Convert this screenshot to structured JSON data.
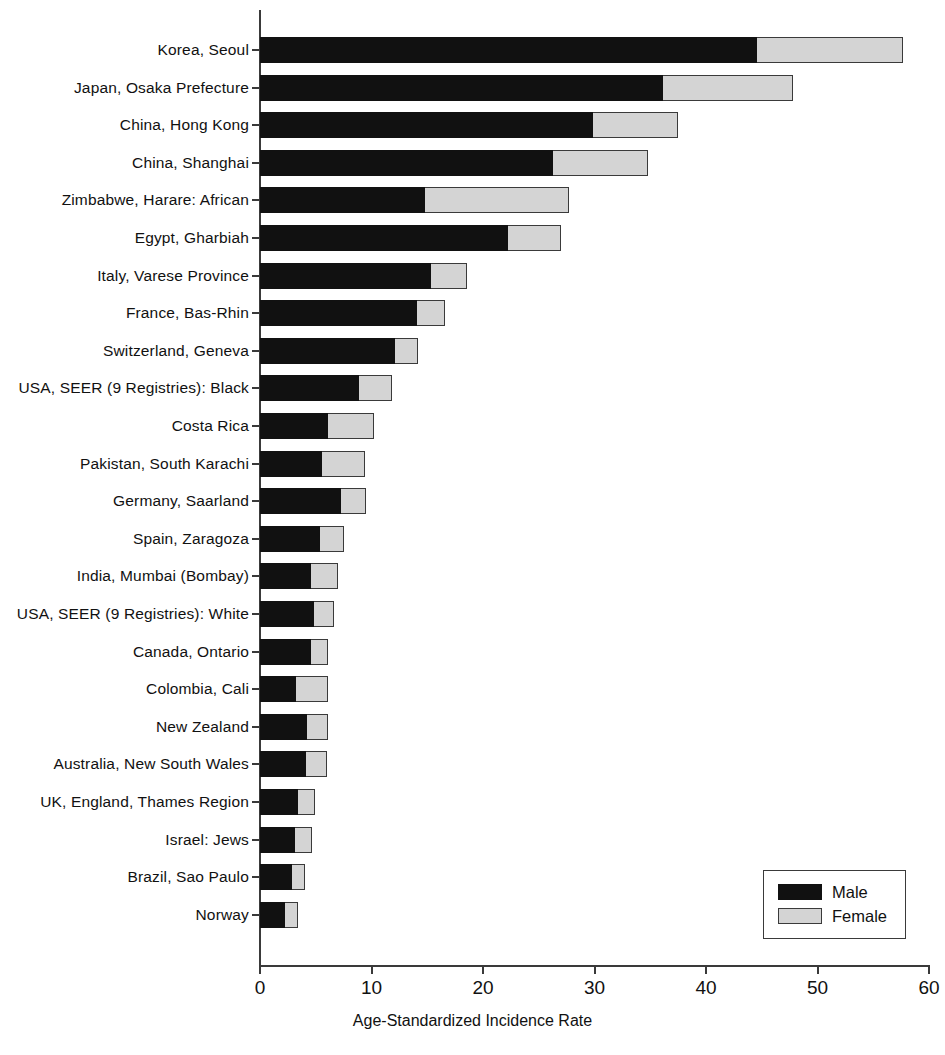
{
  "chart_data": {
    "type": "bar",
    "orientation": "horizontal",
    "stacked": true,
    "title": "",
    "xlabel": "Age-Standardized Incidence Rate",
    "ylabel": "",
    "xlim": [
      0,
      60
    ],
    "xticks": [
      0,
      10,
      20,
      30,
      40,
      50,
      60
    ],
    "xtick_labels": [
      "0",
      "10",
      "20",
      "30",
      "40",
      "50",
      "60"
    ],
    "grid": false,
    "legend": {
      "position": "bottom-right",
      "entries": [
        {
          "name": "Male",
          "color": "#111111"
        },
        {
          "name": "Female",
          "color": "#d4d4d4"
        }
      ]
    },
    "categories": [
      "Korea, Seoul",
      "Japan, Osaka Prefecture",
      "China, Hong Kong",
      "China, Shanghai",
      "Zimbabwe, Harare: African",
      "Egypt, Gharbiah",
      "Italy, Varese Province",
      "France, Bas-Rhin",
      "Switzerland, Geneva",
      "USA, SEER (9 Registries): Black",
      "Costa Rica",
      "Pakistan, South Karachi",
      "Germany, Saarland",
      "Spain, Zaragoza",
      "India, Mumbai (Bombay)",
      "USA, SEER (9 Registries): White",
      "Canada, Ontario",
      "Colombia, Cali",
      "New Zealand",
      "Australia, New South Wales",
      "UK, England, Thames Region",
      "Israel: Jews",
      "Brazil, Sao Paulo",
      "Norway"
    ],
    "series": [
      {
        "name": "Male",
        "color": "#111111",
        "values": [
          44.6,
          36.1,
          29.9,
          26.3,
          14.8,
          22.2,
          15.3,
          14.1,
          12.1,
          8.9,
          6.1,
          5.6,
          7.3,
          5.4,
          4.6,
          4.8,
          4.6,
          3.2,
          4.2,
          4.1,
          3.4,
          3.1,
          2.9,
          2.2
        ]
      },
      {
        "name": "Female",
        "color": "#d4d4d4",
        "values": [
          13.1,
          11.7,
          7.6,
          8.5,
          12.9,
          4.8,
          3.3,
          2.5,
          2.1,
          2.9,
          4.1,
          3.8,
          2.2,
          2.1,
          2.4,
          1.8,
          1.5,
          2.9,
          1.9,
          1.9,
          1.5,
          1.6,
          1.1,
          1.2
        ]
      }
    ],
    "totals": [
      57.7,
      47.8,
      37.5,
      34.8,
      27.7,
      27.0,
      18.6,
      16.6,
      14.2,
      11.8,
      10.2,
      9.4,
      9.5,
      7.5,
      7.0,
      6.6,
      6.1,
      6.1,
      6.1,
      6.0,
      4.9,
      4.7,
      4.0,
      3.4
    ]
  }
}
